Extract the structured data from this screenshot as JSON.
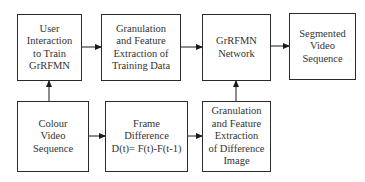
{
  "diagram": {
    "type": "flowchart",
    "nodes": [
      {
        "id": "user_interaction",
        "lines": [
          "User",
          "Interaction",
          "to Train",
          "GrRFMN"
        ]
      },
      {
        "id": "granulation_training",
        "lines": [
          "Granulation",
          "and Feature",
          "Extraction of",
          "Training Data"
        ]
      },
      {
        "id": "grrfmn_network",
        "lines": [
          "GrRFMN",
          "Network"
        ]
      },
      {
        "id": "segmented_video",
        "lines": [
          "Segmented",
          "Video",
          "Sequence"
        ]
      },
      {
        "id": "colour_video",
        "lines": [
          "Colour",
          "Video",
          "Sequence"
        ]
      },
      {
        "id": "frame_difference",
        "lines": [
          "Frame",
          "Difference",
          "D(t)=  F(t)-F(t-1)"
        ]
      },
      {
        "id": "granulation_difference",
        "lines": [
          "Granulation",
          "and Feature",
          "Extraction",
          "of Difference",
          "Image"
        ]
      }
    ],
    "edges": [
      {
        "from": "colour_video",
        "to": "user_interaction"
      },
      {
        "from": "user_interaction",
        "to": "granulation_training"
      },
      {
        "from": "granulation_training",
        "to": "grrfmn_network"
      },
      {
        "from": "grrfmn_network",
        "to": "segmented_video"
      },
      {
        "from": "colour_video",
        "to": "frame_difference"
      },
      {
        "from": "frame_difference",
        "to": "granulation_difference"
      },
      {
        "from": "granulation_difference",
        "to": "grrfmn_network"
      }
    ],
    "colors": {
      "stroke": "#2a2a2a",
      "text": "#333333",
      "background": "#ffffff"
    }
  }
}
